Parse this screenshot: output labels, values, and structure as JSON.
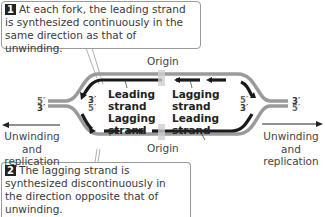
{
  "callouts": [
    {
      "number": "1",
      "text": "At each fork, the leading strand is synthesized continuously in the same direction as that of unwinding."
    },
    {
      "number": "2",
      "text": "The lagging strand is synthesized discontinuously in the direction opposite that of unwinding."
    }
  ],
  "labels": {
    "origin_top": "Origin",
    "origin_bottom": "Origin",
    "left_leading": "Leading\nstrand",
    "left_lagging": "Lagging\nstrand",
    "right_lagging": "Lagging\nstrand",
    "right_leading": "Leading\nstrand",
    "left_direction": "Unwinding\nand\nreplication",
    "right_direction": "Unwinding\nand\nreplication"
  },
  "strand_ends": {
    "left_outer_top": "5′",
    "left_outer_bottom": "3′",
    "left_inner_top": "3′",
    "left_inner_bottom": "5′",
    "right_inner_top": "5′",
    "right_inner_bottom": "3′",
    "right_outer_top": "3′",
    "right_outer_bottom": "5′"
  },
  "colors": {
    "parental_strand": "#9a9a9a",
    "new_strand": "#1a1a1a",
    "origin_marker": "#d0d0d0"
  }
}
